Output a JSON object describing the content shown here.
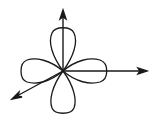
{
  "diagram": {
    "background": "#ffffff",
    "stroke_color": "#1a1a1a",
    "origin": [
      63,
      71
    ],
    "lobes": [
      "top",
      "right",
      "bottom",
      "left"
    ],
    "axes": [
      "vertical-up",
      "horizontal-right",
      "diagonal-down-left"
    ]
  }
}
